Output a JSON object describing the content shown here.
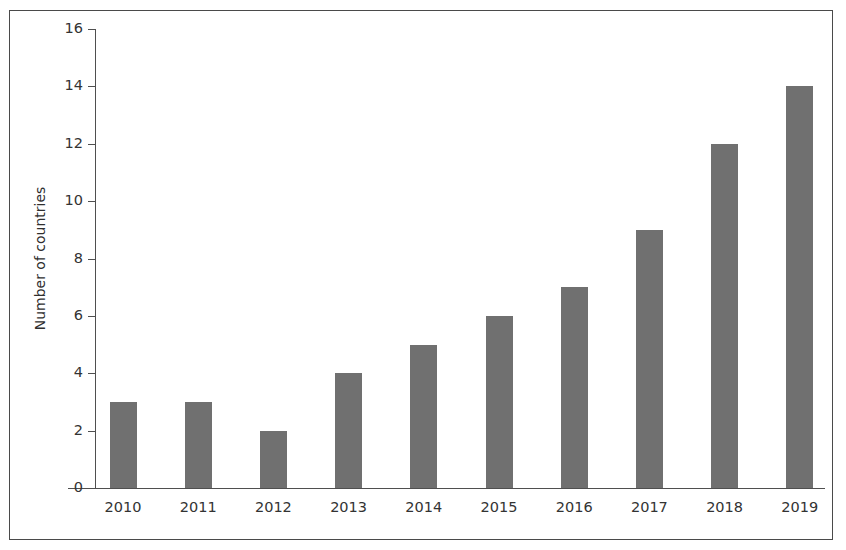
{
  "chart_data": {
    "type": "bar",
    "title": "",
    "subtitle": "",
    "xlabel": "",
    "ylabel": "Number of countries",
    "categories": [
      "2010",
      "2011",
      "2012",
      "2013",
      "2014",
      "2015",
      "2016",
      "2017",
      "2018",
      "2019"
    ],
    "values": [
      3,
      3,
      2,
      4,
      5,
      6,
      7,
      9,
      12,
      14
    ],
    "series": [
      {
        "name": "Number of countries",
        "values": [
          3,
          3,
          2,
          4,
          5,
          6,
          7,
          9,
          12,
          14
        ]
      }
    ],
    "ylim": [
      0,
      16
    ],
    "yticks": [
      0,
      2,
      4,
      6,
      8,
      10,
      12,
      14,
      16
    ],
    "ytick_labels": [
      "0",
      "2",
      "4",
      "6",
      "8",
      "10",
      "12",
      "14",
      "16"
    ],
    "xtick_labels": [
      "2010",
      "2011",
      "2012",
      "2013",
      "2014",
      "2015",
      "2016",
      "2017",
      "2018",
      "2019"
    ],
    "grid": false,
    "legend": null,
    "legend_position": "none",
    "bar_color": "#707070",
    "axis_color": "#4f4f4f",
    "text_color": "#333333",
    "frame_color": "#4a4a4a",
    "background_color": "#ffffff",
    "annotations": []
  }
}
